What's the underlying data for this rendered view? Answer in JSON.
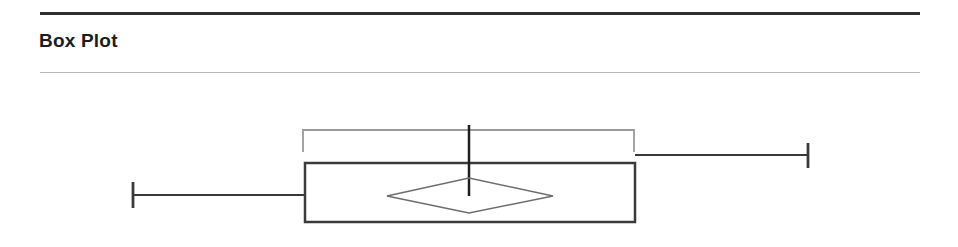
{
  "header": {
    "title": "Box Plot",
    "rule_top_color": "#2f2f2f",
    "rule_bottom_color": "#b9b9b9"
  },
  "chart_data": {
    "type": "box",
    "title": "Box Plot",
    "orientation": "horizontal",
    "xlabel": "",
    "ylabel": "",
    "grid": false,
    "legend": null,
    "axis_ticks": [],
    "tick_labels": [],
    "series": [
      {
        "name": "distribution",
        "min": 133,
        "q1": 305,
        "median": 469,
        "q3": 635,
        "max": 808,
        "mean": 469,
        "mean_marker": "diamond",
        "mean_ci_low": 303,
        "mean_ci_high": 634,
        "outliers": []
      }
    ],
    "elements": {
      "box": {
        "x1": 305,
        "x2": 635,
        "y1": 163,
        "y2": 222,
        "fill": "#ffffff",
        "stroke": "#3a3a3a",
        "stroke_width": 2.5
      },
      "median_line": {
        "x": 469,
        "y1": 125,
        "y2": 196,
        "stroke": "#1f1f1f",
        "stroke_width": 2.5
      },
      "whisker_left": {
        "x1": 133,
        "x2": 305,
        "y": 195,
        "cap_y1": 182,
        "cap_y2": 208,
        "stroke": "#3a3a3a",
        "stroke_width": 2
      },
      "whisker_right": {
        "x1": 635,
        "x2": 808,
        "y": 155,
        "cap_y1": 143,
        "cap_y2": 168,
        "stroke": "#3a3a3a",
        "stroke_width": 2
      },
      "mean_diamond": {
        "left_x": 387,
        "right_x": 553,
        "center_x": 469,
        "center_y": 196,
        "top_y": 178,
        "bottom_y": 213,
        "stroke": "#6e6e6e",
        "stroke_width": 1.6,
        "fill": "none"
      },
      "bracket": {
        "x1": 303,
        "x2": 634,
        "y": 130,
        "tick_bottom_y": 152,
        "stroke": "#9a9a9a",
        "stroke_width": 1.8
      }
    }
  }
}
